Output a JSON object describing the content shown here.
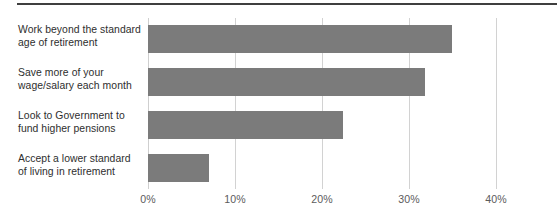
{
  "chart_data": {
    "type": "bar",
    "orientation": "horizontal",
    "title": "",
    "subtitle": "",
    "xlabel": "",
    "ylabel": "",
    "xlim": [
      0,
      40
    ],
    "grid": true,
    "legend": null,
    "xtick_labels": [
      "0%",
      "10%",
      "20%",
      "30%",
      "40%"
    ],
    "xtick_values": [
      0,
      10,
      20,
      30,
      40
    ],
    "categories": [
      "Work beyond the standard age of retirement",
      "Save more of your wage/salary each month",
      "Look to Government to fund higher pensions",
      "Accept a lower standard of living in retirement"
    ],
    "category_lines": [
      [
        "Work beyond the standard",
        "age of retirement"
      ],
      [
        "Save more of your",
        "wage/salary each month"
      ],
      [
        "Look to Government to",
        "fund higher pensions"
      ],
      [
        "Accept a lower standard",
        "of living in retirement"
      ]
    ],
    "values": [
      34.9,
      31.8,
      22.4,
      7.0
    ],
    "units": "percent",
    "colors": {
      "bar": "#7b7b7b",
      "gridline": "#d2d2d2",
      "rule": "#3f3f3f",
      "label_text": "#2e2e2e",
      "tick_text": "#5c5c5c",
      "background": "#ffffff"
    }
  }
}
